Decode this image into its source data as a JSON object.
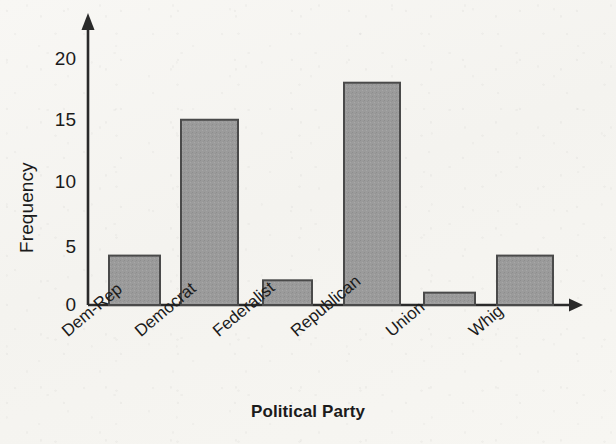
{
  "chart_data": {
    "type": "bar",
    "title": "",
    "xlabel": "Political Party",
    "ylabel": "Frequency",
    "categories": [
      "Dem-Rep",
      "Democrat",
      "Federalist",
      "Republican",
      "Union",
      "Whig"
    ],
    "values": [
      4,
      15,
      2,
      18,
      1,
      4
    ],
    "ylim": [
      0,
      22
    ],
    "yticks": [
      0,
      5,
      10,
      15,
      20
    ],
    "ytick_labels": [
      "0",
      "5",
      "10",
      "15",
      "20"
    ],
    "grid": false,
    "legend": null,
    "legend_position": "none",
    "bar_fill": "#9b9b9b",
    "bar_stroke": "#4a4a4a",
    "axis_color": "#2a2a2a",
    "background": "#f7f6f3",
    "axis_style": "arrow-tipped open axes"
  },
  "figure": {
    "y_axis_name": "frequency-axis",
    "x_axis_name": "political-party-axis"
  }
}
